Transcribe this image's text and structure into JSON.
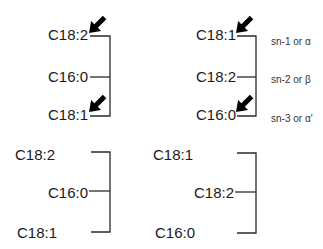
{
  "diagram": {
    "type": "triacylglycerol positional isomers",
    "colors": {
      "text": "#1a1a1a",
      "line": "#2a2a2a",
      "arrow": "#000000"
    },
    "panels": [
      {
        "id": "top-left",
        "fatty_acids": [
          "C18:2",
          "C16:0",
          "C18:1"
        ],
        "arrows_on": [
          "C18:2",
          "C18:1"
        ],
        "layout": "fischer"
      },
      {
        "id": "top-right",
        "fatty_acids": [
          "C18:1",
          "C18:2",
          "C16:0"
        ],
        "arrows_on": [
          "C18:1",
          "C16:0"
        ],
        "layout": "fischer"
      },
      {
        "id": "bottom-left",
        "fatty_acids": [
          "C18:2",
          "C16:0",
          "C18:1"
        ],
        "arrows_on": [],
        "layout": "staggered"
      },
      {
        "id": "bottom-right",
        "fatty_acids": [
          "C18:1",
          "C18:2",
          "C16:0"
        ],
        "arrows_on": [],
        "layout": "staggered"
      }
    ],
    "positions": [
      "sn-1 or α",
      "sn-2 or β",
      "sn-3 or α'"
    ]
  }
}
